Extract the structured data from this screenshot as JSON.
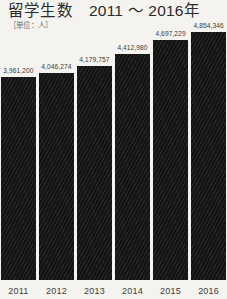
{
  "chart_data": {
    "type": "bar",
    "title": "留学生数　2011 ～ 2016年",
    "subtitle": "［単位：人］",
    "xlabel": "",
    "ylabel": "",
    "categories": [
      "2011",
      "2012",
      "2013",
      "2014",
      "2015",
      "2016"
    ],
    "values": [
      3961200,
      4046274,
      4179757,
      4412980,
      4697229,
      4854346
    ],
    "value_labels": [
      "3,961,200",
      "4,046,274",
      "4,179,757",
      "4,412,980",
      "4,697,229",
      "4,854,346"
    ],
    "ylim": [
      0,
      5100000
    ],
    "grid": false,
    "legend": null,
    "colors": {
      "background": "#f5f3ef",
      "bar": "#131313",
      "title_text": "#2b2b2b",
      "subtitle_text": "#6d6d6d",
      "value_text": "#3a3a3a",
      "tick_text": "#3d3d3d"
    }
  },
  "layout": {
    "bars": [
      {
        "left": 1,
        "width": 37,
        "height": 193,
        "label_bottom": 196
      },
      {
        "left": 42,
        "width": 38,
        "height": 201,
        "label_bottom": 204
      },
      {
        "left": 83,
        "width": 38,
        "height": 213,
        "label_bottom": 216
      },
      {
        "left": 122,
        "width": 38,
        "height": 233,
        "label_bottom": 236
      },
      {
        "left": 150,
        "width": 38,
        "height": 258,
        "label_bottom": 261
      },
      {
        "left": 188,
        "width": 38,
        "height": 272,
        "label_bottom": 275
      }
    ]
  }
}
